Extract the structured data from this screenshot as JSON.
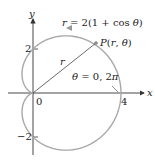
{
  "figure": {
    "curve_equation": "r = 2(1 + cos θ)",
    "point_label": "P(r, θ)",
    "radius_label": "r",
    "angle_label": "θ = 0, 2π",
    "axes": {
      "x_label": "x",
      "y_label": "y"
    },
    "ticks": {
      "origin": "0",
      "x4": "4",
      "y2": "2",
      "yneg2": "−2"
    },
    "colors": {
      "curve": "#a8a8a8",
      "axes": "#333333",
      "radius": "#444444"
    }
  }
}
